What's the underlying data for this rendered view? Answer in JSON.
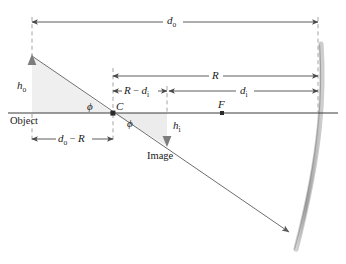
{
  "figure": {
    "background_color": "#ffffff",
    "line_color": "#4a4a4a",
    "axis_color": "#3a3a3a",
    "shade_color": "#efefef",
    "arrow_color": "#8a8a8a",
    "mirror_color": "#b8b8b8"
  },
  "labels": {
    "d_o": {
      "base": "d",
      "sub": "o"
    },
    "d_o_minus_R": {
      "base": "d",
      "sub": "o",
      "op": " − ",
      "tail": "R"
    },
    "R": {
      "base": "R",
      "sub": ""
    },
    "R_minus_d_i": {
      "base": "R",
      "op": " − ",
      "tail": "d",
      "tail_sub": "i"
    },
    "d_i": {
      "base": "d",
      "sub": "i"
    },
    "h_o": {
      "base": "h",
      "sub": "o"
    },
    "h_i": {
      "base": "h",
      "sub": "i"
    },
    "C": "C",
    "F": "F",
    "phi_upper": "ϕ",
    "phi_lower": "ϕ",
    "object": "Object",
    "image": "Image"
  },
  "geometry": {
    "axis_y": 113,
    "object_x": 32,
    "object_top_y": 56,
    "center_C_x": 113,
    "image_x": 167,
    "focus_F_x": 222,
    "mirror_vertex_x": 318,
    "image_bottom_y": 146,
    "dim_do_y": 22,
    "dim_R_y": 76,
    "dim_di_y": 91,
    "dim_doR_y": 133
  }
}
